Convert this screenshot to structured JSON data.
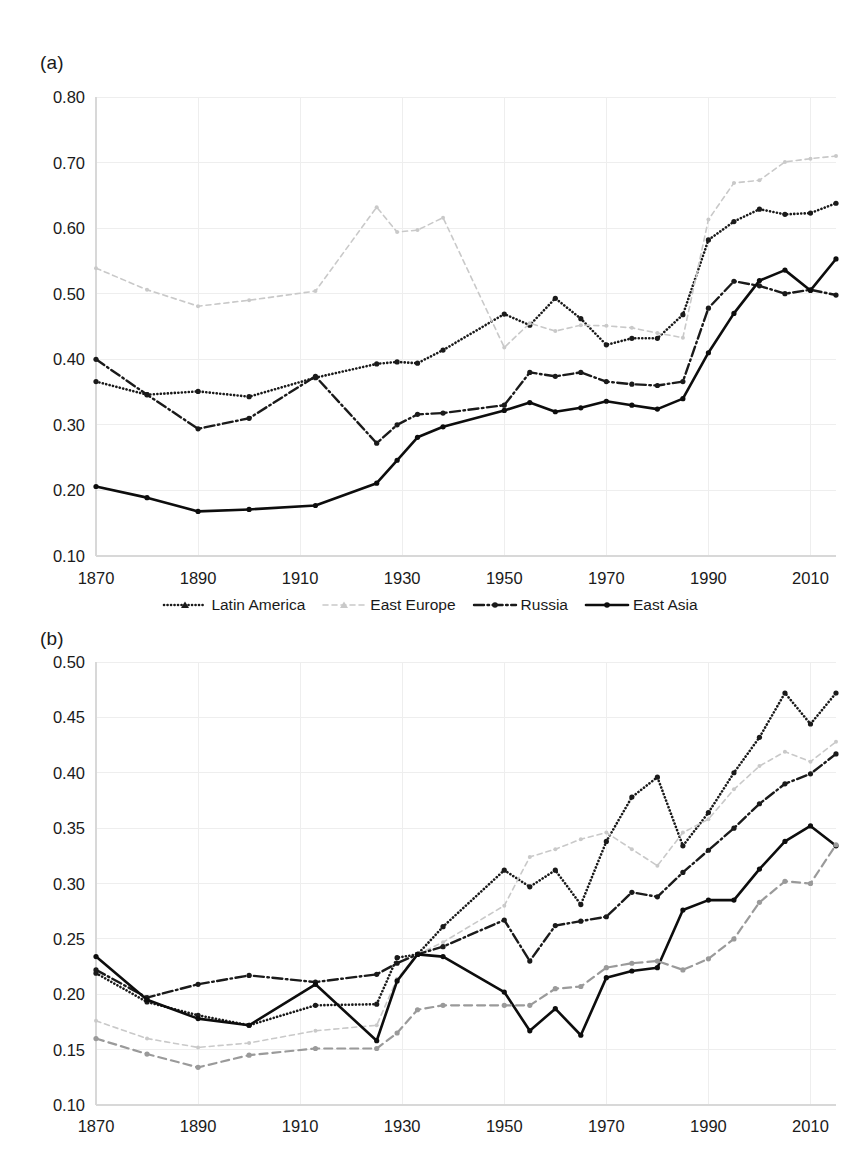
{
  "figure": {
    "panel_a_label": "(a)",
    "panel_b_label": "(b)"
  },
  "legend": {
    "position": "below-panel-a",
    "items": [
      {
        "label": "Latin America",
        "style": "dotted",
        "color": "#1a1a1a",
        "marker": "triangle"
      },
      {
        "label": "East Europe",
        "style": "dashed",
        "color": "#c9c9c9",
        "marker": "triangle"
      },
      {
        "label": "Russia",
        "style": "dash-dot",
        "color": "#1a1a1a",
        "marker": "circle"
      },
      {
        "label": "East Asia",
        "style": "solid",
        "color": "#0d0d0d",
        "marker": "circle"
      }
    ]
  },
  "colors": {
    "dark": "#1a1a1a",
    "black": "#0d0d0d",
    "light_gray": "#c9c9c9",
    "mid_gray": "#9a9a9a",
    "grid": "#eeeeee",
    "axis": "#d8d8d8"
  },
  "chart_data": [
    {
      "type": "line",
      "panel": "(a)",
      "title": "",
      "xlabel": "",
      "ylabel": "",
      "xlim": [
        1870,
        2015
      ],
      "ylim": [
        0.1,
        0.8
      ],
      "ytick_labels": [
        "0.10",
        "0.20",
        "0.30",
        "0.40",
        "0.50",
        "0.60",
        "0.70",
        "0.80"
      ],
      "ytick_values": [
        0.1,
        0.2,
        0.3,
        0.4,
        0.5,
        0.6,
        0.7,
        0.8
      ],
      "xtick_labels": [
        "1870",
        "1890",
        "1910",
        "1930",
        "1950",
        "1970",
        "1990",
        "2010"
      ],
      "xtick_values": [
        1870,
        1890,
        1910,
        1930,
        1950,
        1970,
        1990,
        2010
      ],
      "grid": true,
      "legend_position": "bottom",
      "series": [
        {
          "name": "Latin America",
          "style": "dotted",
          "color": "#1a1a1a",
          "marker": "triangle",
          "x": [
            1870,
            1880,
            1890,
            1900,
            1913,
            1925,
            1929,
            1933,
            1938,
            1950,
            1955,
            1960,
            1965,
            1970,
            1975,
            1980,
            1985,
            1990,
            1995,
            2000,
            2005,
            2010,
            2015
          ],
          "y": [
            0.366,
            0.346,
            0.351,
            0.343,
            0.372,
            0.393,
            0.396,
            0.394,
            0.414,
            0.469,
            0.452,
            0.493,
            0.462,
            0.422,
            0.432,
            0.432,
            0.468,
            0.582,
            0.61,
            0.629,
            0.621,
            0.623,
            0.638
          ]
        },
        {
          "name": "East Europe",
          "style": "dashed",
          "color": "#c9c9c9",
          "marker": "triangle",
          "x": [
            1870,
            1880,
            1890,
            1900,
            1913,
            1925,
            1929,
            1933,
            1938,
            1950,
            1955,
            1960,
            1965,
            1970,
            1975,
            1980,
            1985,
            1990,
            1995,
            2000,
            2005,
            2010,
            2015
          ],
          "y": [
            0.539,
            0.506,
            0.481,
            0.49,
            0.504,
            0.632,
            0.594,
            0.597,
            0.616,
            0.418,
            0.455,
            0.443,
            0.452,
            0.451,
            0.448,
            0.44,
            0.433,
            0.613,
            0.669,
            0.673,
            0.701,
            0.706,
            0.71
          ]
        },
        {
          "name": "Russia",
          "style": "dash-dot",
          "color": "#1a1a1a",
          "marker": "circle",
          "x": [
            1870,
            1880,
            1890,
            1900,
            1913,
            1925,
            1929,
            1933,
            1938,
            1950,
            1955,
            1960,
            1965,
            1970,
            1975,
            1980,
            1985,
            1990,
            1995,
            2000,
            2005,
            2010,
            2015
          ],
          "y": [
            0.4,
            0.346,
            0.294,
            0.31,
            0.374,
            0.272,
            0.3,
            0.316,
            0.318,
            0.33,
            0.38,
            0.374,
            0.38,
            0.366,
            0.362,
            0.36,
            0.366,
            0.478,
            0.519,
            0.512,
            0.5,
            0.506,
            0.498
          ]
        },
        {
          "name": "East Asia",
          "style": "solid",
          "color": "#0d0d0d",
          "marker": "circle",
          "x": [
            1870,
            1880,
            1890,
            1900,
            1913,
            1925,
            1929,
            1933,
            1938,
            1950,
            1955,
            1960,
            1965,
            1970,
            1975,
            1980,
            1985,
            1990,
            1995,
            2000,
            2005,
            2010,
            2015
          ],
          "y": [
            0.206,
            0.189,
            0.168,
            0.171,
            0.177,
            0.211,
            0.246,
            0.281,
            0.297,
            0.322,
            0.334,
            0.32,
            0.326,
            0.336,
            0.33,
            0.324,
            0.34,
            0.41,
            0.47,
            0.52,
            0.536,
            0.505,
            0.553
          ]
        }
      ]
    },
    {
      "type": "line",
      "panel": "(b)",
      "title": "",
      "xlabel": "",
      "ylabel": "",
      "xlim": [
        1870,
        2015
      ],
      "ylim": [
        0.1,
        0.5
      ],
      "ytick_labels": [
        "0.10",
        "0.15",
        "0.20",
        "0.25",
        "0.30",
        "0.35",
        "0.40",
        "0.45",
        "0.50"
      ],
      "ytick_values": [
        0.1,
        0.15,
        0.2,
        0.25,
        0.3,
        0.35,
        0.4,
        0.45,
        0.5
      ],
      "xtick_labels": [
        "1870",
        "1890",
        "1910",
        "1930",
        "1950",
        "1970",
        "1990",
        "2010"
      ],
      "xtick_values": [
        1870,
        1890,
        1910,
        1930,
        1950,
        1970,
        1990,
        2010
      ],
      "grid": true,
      "legend_position": "none",
      "series": [
        {
          "name": "Latin America",
          "style": "dotted",
          "color": "#1a1a1a",
          "marker": "circle",
          "x": [
            1870,
            1880,
            1890,
            1900,
            1913,
            1925,
            1929,
            1933,
            1938,
            1950,
            1955,
            1960,
            1965,
            1970,
            1975,
            1980,
            1985,
            1990,
            1995,
            2000,
            2005,
            2010,
            2015
          ],
          "y": [
            0.219,
            0.193,
            0.181,
            0.172,
            0.19,
            0.191,
            0.233,
            0.236,
            0.261,
            0.312,
            0.297,
            0.312,
            0.281,
            0.338,
            0.378,
            0.396,
            0.334,
            0.364,
            0.4,
            0.432,
            0.472,
            0.444,
            0.472
          ]
        },
        {
          "name": "East Europe",
          "style": "dashed",
          "color": "#c9c9c9",
          "marker": "circle",
          "x": [
            1870,
            1880,
            1890,
            1900,
            1913,
            1925,
            1929,
            1933,
            1938,
            1950,
            1955,
            1960,
            1965,
            1970,
            1975,
            1980,
            1985,
            1990,
            1995,
            2000,
            2005,
            2010,
            2015
          ],
          "y": [
            0.176,
            0.16,
            0.152,
            0.156,
            0.167,
            0.172,
            0.214,
            0.236,
            0.247,
            0.28,
            0.324,
            0.331,
            0.34,
            0.346,
            0.331,
            0.316,
            0.346,
            0.358,
            0.385,
            0.406,
            0.419,
            0.41,
            0.428
          ]
        },
        {
          "name": "Russia",
          "style": "dash-dot",
          "color": "#1a1a1a",
          "marker": "circle",
          "x": [
            1870,
            1880,
            1890,
            1900,
            1913,
            1925,
            1929,
            1933,
            1938,
            1950,
            1955,
            1960,
            1965,
            1970,
            1975,
            1980,
            1985,
            1990,
            1995,
            2000,
            2005,
            2010,
            2015
          ],
          "y": [
            0.222,
            0.197,
            0.209,
            0.217,
            0.211,
            0.218,
            0.228,
            0.236,
            0.243,
            0.267,
            0.23,
            0.262,
            0.266,
            0.27,
            0.292,
            0.288,
            0.31,
            0.33,
            0.35,
            0.372,
            0.39,
            0.399,
            0.417
          ]
        },
        {
          "name": "East Asia",
          "style": "solid",
          "color": "#0d0d0d",
          "marker": "circle",
          "x": [
            1870,
            1880,
            1890,
            1900,
            1913,
            1925,
            1929,
            1933,
            1938,
            1950,
            1955,
            1960,
            1965,
            1970,
            1975,
            1980,
            1985,
            1990,
            1995,
            2000,
            2005,
            2010,
            2015
          ],
          "y": [
            0.234,
            0.195,
            0.178,
            0.172,
            0.209,
            0.158,
            0.212,
            0.236,
            0.234,
            0.202,
            0.167,
            0.187,
            0.163,
            0.215,
            0.221,
            0.224,
            0.276,
            0.285,
            0.285,
            0.313,
            0.338,
            0.352,
            0.334
          ]
        },
        {
          "name": "World",
          "style": "dashed-gray",
          "color": "#9a9a9a",
          "marker": "circle",
          "x": [
            1870,
            1880,
            1890,
            1900,
            1913,
            1925,
            1929,
            1933,
            1938,
            1950,
            1955,
            1960,
            1965,
            1970,
            1975,
            1980,
            1985,
            1990,
            1995,
            2000,
            2005,
            2010,
            2015
          ],
          "y": [
            0.16,
            0.146,
            0.134,
            0.145,
            0.151,
            0.151,
            0.165,
            0.186,
            0.19,
            0.19,
            0.19,
            0.205,
            0.207,
            0.224,
            0.228,
            0.23,
            0.222,
            0.232,
            0.25,
            0.283,
            0.302,
            0.3,
            0.335
          ]
        }
      ]
    }
  ]
}
